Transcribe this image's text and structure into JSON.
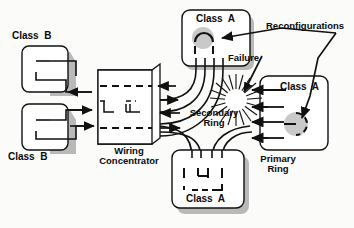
{
  "diagram": {
    "colors": {
      "line": "#111111",
      "shadow": "#b9b9b9",
      "face": "#ffffff",
      "halo": "#c9c9c9",
      "background": "#fbfbfa"
    }
  },
  "labels": {
    "class_b_top": "Class  B",
    "class_b_bottom": "Class  B",
    "wiring_concentrator": "Wiring\nConcentrator",
    "class_a_top": "Class  A",
    "class_a_right": "Class  A",
    "class_a_bottom": "Class  A",
    "reconfigurations": "Reconfigurations",
    "failure": "Failure",
    "secondary_ring": "Secondary\nRing",
    "primary_ring": "Primary\nRing"
  },
  "nodes": [
    {
      "id": "class-b-top",
      "label": "Class  B",
      "type": "station",
      "class": "B"
    },
    {
      "id": "class-b-bottom",
      "label": "Class  B",
      "type": "station",
      "class": "B"
    },
    {
      "id": "wiring-concentrator",
      "label": "Wiring Concentrator",
      "type": "concentrator"
    },
    {
      "id": "class-a-top",
      "label": "Class  A",
      "type": "station",
      "class": "A",
      "state": "wrapped"
    },
    {
      "id": "class-a-right",
      "label": "Class  A",
      "type": "station",
      "class": "A",
      "state": "wrapped"
    },
    {
      "id": "class-a-bottom",
      "label": "Class  A",
      "type": "station",
      "class": "A",
      "state": "normal"
    }
  ],
  "annotations": [
    {
      "id": "failure-marker",
      "label": "Failure",
      "shape": "starburst"
    },
    {
      "id": "reconfigurations-callout",
      "label": "Reconfigurations",
      "targets": 2
    },
    {
      "id": "secondary-ring-label",
      "label": "Secondary Ring"
    },
    {
      "id": "primary-ring-label",
      "label": "Primary Ring"
    }
  ]
}
